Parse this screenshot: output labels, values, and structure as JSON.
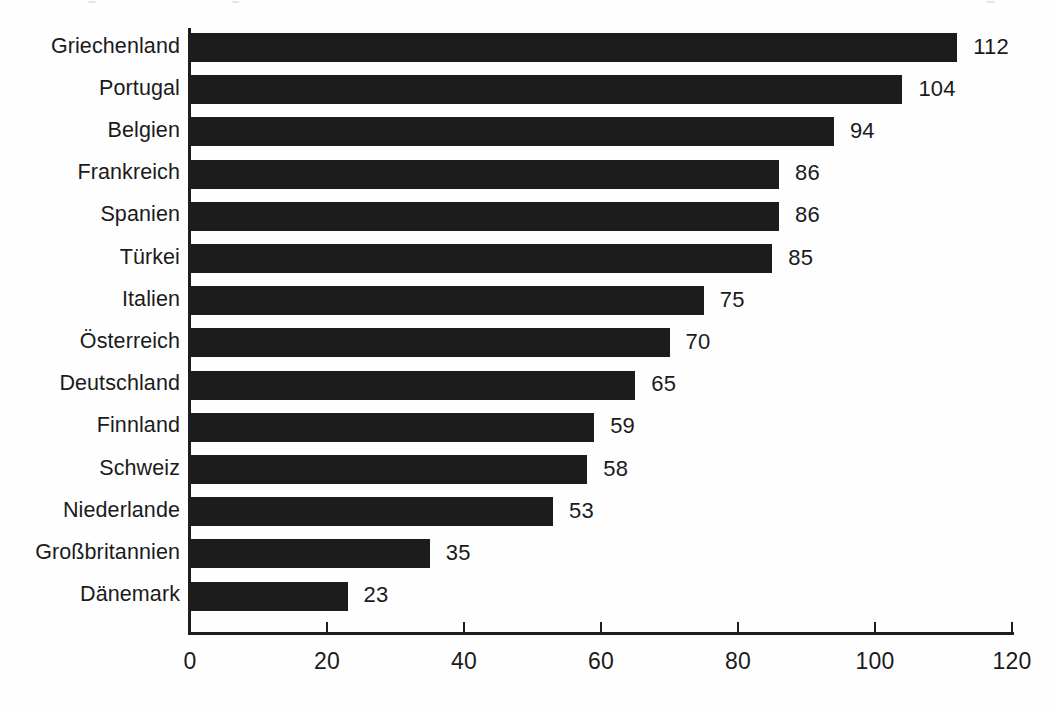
{
  "chart_data": {
    "type": "bar",
    "orientation": "horizontal",
    "title": "",
    "subtitle": "",
    "xlabel": "",
    "ylabel": "",
    "xlim": [
      0,
      120
    ],
    "xticks": [
      "0",
      "20",
      "40",
      "60",
      "80",
      "100",
      "120"
    ],
    "grid": false,
    "legend": false,
    "bar_color": "#1c1c1c",
    "text_color": "#1b1b1b",
    "background_color": "#ffffff",
    "categories": [
      "Griechenland",
      "Portugal",
      "Belgien",
      "Frankreich",
      "Spanien",
      "Türkei",
      "Italien",
      "Österreich",
      "Deutschland",
      "Finnland",
      "Schweiz",
      "Niederlande",
      "Großbritannien",
      "Dänemark"
    ],
    "values": [
      112,
      104,
      94,
      86,
      86,
      85,
      75,
      70,
      65,
      59,
      58,
      53,
      35,
      23
    ],
    "value_labels": [
      "112",
      "104",
      "94",
      "86",
      "86",
      "85",
      "75",
      "70",
      "65",
      "59",
      "58",
      "53",
      "35",
      "23"
    ],
    "rows": [
      {
        "category": "Griechenland",
        "value": 112,
        "label": "112"
      },
      {
        "category": "Portugal",
        "value": 104,
        "label": "104"
      },
      {
        "category": "Belgien",
        "value": 94,
        "label": "94"
      },
      {
        "category": "Frankreich",
        "value": 86,
        "label": "86"
      },
      {
        "category": "Spanien",
        "value": 86,
        "label": "86"
      },
      {
        "category": "Türkei",
        "value": 85,
        "label": "85"
      },
      {
        "category": "Italien",
        "value": 75,
        "label": "75"
      },
      {
        "category": "Österreich",
        "value": 70,
        "label": "70"
      },
      {
        "category": "Deutschland",
        "value": 65,
        "label": "65"
      },
      {
        "category": "Finnland",
        "value": 59,
        "label": "59"
      },
      {
        "category": "Schweiz",
        "value": 58,
        "label": "58"
      },
      {
        "category": "Niederlande",
        "value": 53,
        "label": "53"
      },
      {
        "category": "Großbritannien",
        "value": 35,
        "label": "35"
      },
      {
        "category": "Dänemark",
        "value": 23,
        "label": "23"
      }
    ]
  },
  "geometry": {
    "origin_x": 190,
    "axis_end_x": 1012,
    "px_per_unit": 6.85,
    "first_bar_top": 33,
    "row_pitch": 42.2,
    "bar_height": 29,
    "axis_y": 632,
    "tick_length": 10,
    "tick_label_y": 648
  }
}
